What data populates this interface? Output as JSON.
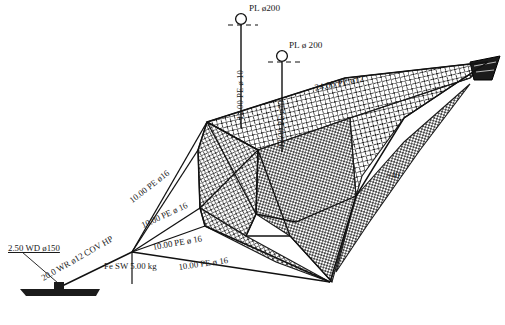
{
  "diagram": {
    "background_color": "#ffffff",
    "ink_color": "#111111"
  },
  "floats": [
    {
      "id": "float-left",
      "label": "PL ø200"
    },
    {
      "id": "float-right",
      "label": "PL ø 200"
    }
  ],
  "float_lines": [
    {
      "id": "float-line-left",
      "label": "12.00 PE ø 10"
    },
    {
      "id": "float-line-right",
      "label": "12.00 PE ø10"
    }
  ],
  "headline": {
    "label": "24.00 PE ø12"
  },
  "bridles": [
    {
      "id": "bridle-upper",
      "label": "10.00 PE ø16"
    },
    {
      "id": "bridle-middle",
      "label": "10.00 PE ø 16"
    },
    {
      "id": "bridle-lower",
      "label": "10.00 PE ø 16"
    },
    {
      "id": "bridle-bottom",
      "label": "10.00 PE ø 16"
    }
  ],
  "mooring": {
    "depth_label": "2.50 WD ø150",
    "warp_label": "20.0 WR ø12 COV HP",
    "sinker_label": "Fe SW 5.00 kg"
  },
  "mesh": {
    "count_label": "×40"
  }
}
